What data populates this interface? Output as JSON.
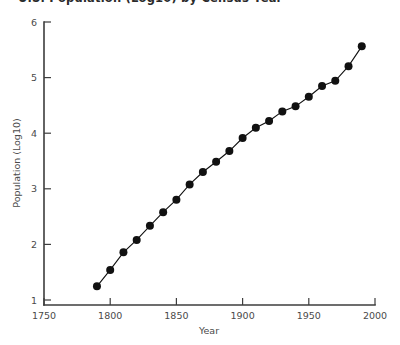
{
  "figure": {
    "title": "U.S. Population (Log10) by Census Year",
    "background_color": "#ffffff",
    "ink_color": "#111111",
    "axis_color": "#3d3d3d"
  },
  "chart_data": {
    "type": "line",
    "title": "U.S. Population (Log10) by Census Year",
    "xlabel": "Year",
    "ylabel": "Population (Log10)",
    "xlim": [
      1750,
      2000
    ],
    "ylim": [
      1,
      6
    ],
    "xticks": [
      1750,
      1800,
      1850,
      1900,
      1950,
      2000
    ],
    "xtick_labels": [
      "1750",
      "1800",
      "1850",
      "1900",
      "1950",
      "2000"
    ],
    "yticks": [
      1,
      2,
      3,
      4,
      5,
      6
    ],
    "ytick_labels": [
      "1",
      "2",
      "3",
      "4",
      "5",
      "6"
    ],
    "grid": false,
    "legend": null,
    "marker": "filled-circle",
    "marker_size_px": 8,
    "x": [
      1790,
      1800,
      1810,
      1820,
      1830,
      1840,
      1850,
      1860,
      1870,
      1880,
      1890,
      1900,
      1910,
      1920,
      1930,
      1940,
      1950,
      1960,
      1970,
      1980,
      1990
    ],
    "y": [
      1.33,
      1.62,
      1.93,
      2.15,
      2.4,
      2.64,
      2.86,
      3.13,
      3.35,
      3.53,
      3.72,
      3.95,
      4.13,
      4.25,
      4.42,
      4.51,
      4.68,
      4.87,
      4.96,
      5.22,
      5.57
    ],
    "series": [
      {
        "name": "U.S. Population (Log10)",
        "x": [
          1790,
          1800,
          1810,
          1820,
          1830,
          1840,
          1850,
          1860,
          1870,
          1880,
          1890,
          1900,
          1910,
          1920,
          1930,
          1940,
          1950,
          1960,
          1970,
          1980,
          1990
        ],
        "values": [
          1.33,
          1.62,
          1.93,
          2.15,
          2.4,
          2.64,
          2.86,
          3.13,
          3.35,
          3.53,
          3.72,
          3.95,
          4.13,
          4.25,
          4.42,
          4.51,
          4.68,
          4.87,
          4.96,
          5.22,
          5.57
        ]
      }
    ]
  }
}
